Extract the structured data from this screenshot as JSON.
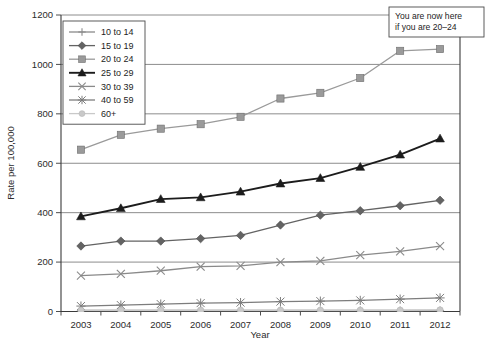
{
  "chart_data": {
    "type": "line",
    "title": "",
    "xlabel": "Year",
    "ylabel": "Rate per 100,000",
    "categories": [
      "2003",
      "2004",
      "2005",
      "2006",
      "2007",
      "2008",
      "2009",
      "2010",
      "2011",
      "2012"
    ],
    "x": [
      2003,
      2004,
      2005,
      2006,
      2007,
      2008,
      2009,
      2010,
      2011,
      2012
    ],
    "ylim": [
      0,
      1200
    ],
    "yticks": [
      0,
      200,
      400,
      600,
      800,
      1000,
      1200
    ],
    "grid": true,
    "legend_position": "top-left",
    "series": [
      {
        "name": "10 to 14",
        "marker": "plus",
        "color": "#8a8a8a",
        "values": [
          4,
          4,
          4,
          4,
          4,
          4,
          4,
          4,
          4,
          4
        ]
      },
      {
        "name": "15 to 19",
        "marker": "diamond",
        "color": "#636363",
        "values": [
          265,
          285,
          285,
          295,
          308,
          350,
          390,
          408,
          428,
          450
        ]
      },
      {
        "name": "20 to 24",
        "marker": "square",
        "color": "#9a9a9a",
        "values": [
          655,
          715,
          740,
          758,
          788,
          862,
          885,
          945,
          1055,
          1062
        ]
      },
      {
        "name": "25 to 29",
        "marker": "triangle",
        "color": "#1c1c1c",
        "values": [
          385,
          418,
          455,
          462,
          485,
          518,
          540,
          585,
          635,
          700
        ]
      },
      {
        "name": "30 to 39",
        "marker": "x-thin",
        "color": "#8a8a8a",
        "values": [
          145,
          152,
          165,
          182,
          185,
          200,
          205,
          228,
          243,
          265
        ]
      },
      {
        "name": "40 to 59",
        "marker": "asterisk",
        "color": "#7d7d7d",
        "values": [
          22,
          26,
          30,
          34,
          36,
          40,
          42,
          45,
          50,
          55
        ]
      },
      {
        "name": "60+",
        "marker": "circle",
        "color": "#c9c9c9",
        "values": [
          5,
          5,
          5,
          5,
          5,
          5,
          5,
          5,
          5,
          6
        ]
      }
    ],
    "annotations": [
      {
        "id": "callout-now-here",
        "lines": [
          "You are now here",
          "if you are 20–24"
        ],
        "points_to_series": "20 to 24"
      }
    ]
  }
}
